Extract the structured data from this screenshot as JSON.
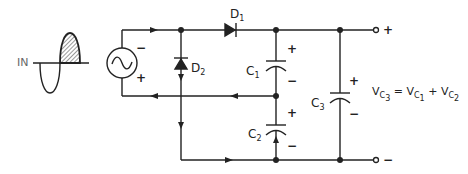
{
  "diagram": {
    "input_label": "IN",
    "source": {
      "label": "~",
      "top_polarity": "−",
      "bottom_polarity": "+"
    },
    "components": [
      {
        "id": "D1",
        "label": "D",
        "subscript": "1",
        "type": "diode"
      },
      {
        "id": "D2",
        "label": "D",
        "subscript": "2",
        "type": "diode"
      },
      {
        "id": "C1",
        "label": "C",
        "subscript": "1",
        "type": "capacitor",
        "top_polarity": "+",
        "bottom_polarity": "−"
      },
      {
        "id": "C2",
        "label": "C",
        "subscript": "2",
        "type": "capacitor",
        "top_polarity": "+",
        "bottom_polarity": "−"
      },
      {
        "id": "C3",
        "label": "C",
        "subscript": "3",
        "type": "capacitor",
        "top_polarity": "+",
        "bottom_polarity": "−"
      }
    ],
    "output": {
      "positive": "+",
      "negative": "−"
    },
    "equation": {
      "lhs_v": "V",
      "lhs_c": "C",
      "lhs_sub": "3",
      "eq": " = ",
      "t1_v": "V",
      "t1_c": "C",
      "t1_sub": "1",
      "plus": " + ",
      "t2_v": "V",
      "t2_c": "C",
      "t2_sub": "2"
    },
    "colors": {
      "line": "#222222",
      "hatch": "#555555",
      "input_label": "#666666"
    }
  }
}
